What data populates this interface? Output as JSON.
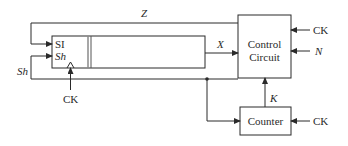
{
  "diagram": {
    "shift_register": {
      "inputs": {
        "si": "SI",
        "sh": "Sh"
      },
      "clock": "CK"
    },
    "control_circuit": {
      "line1": "Control",
      "line2": "Circuit",
      "inputs": {
        "ck": "CK",
        "n": "N"
      }
    },
    "counter": {
      "label": "Counter",
      "clock": "CK"
    },
    "signals": {
      "z": "Z",
      "x": "X",
      "sh": "Sh",
      "k": "K"
    },
    "colors": {
      "stroke": "#2a2a2a",
      "divider": "#8a8a8a",
      "background": "#ffffff"
    }
  }
}
